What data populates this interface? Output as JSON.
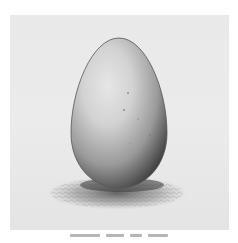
{
  "image": {
    "subject": "pencil drawing of an egg standing upright on a scribbled shadow",
    "colors": {
      "background": "#ffffff",
      "paper": "#eaeaea",
      "egg_light": "#e2e2e2",
      "egg_mid": "#a8a8a8",
      "egg_dark": "#4a4a4a",
      "shadow": "#6a6a6a"
    }
  },
  "caption": {
    "text": "",
    "legible": false
  }
}
